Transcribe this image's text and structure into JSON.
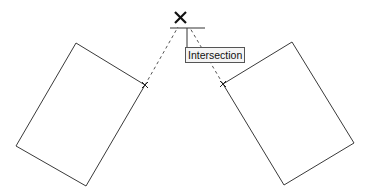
{
  "tooltip": {
    "label": "Intersection"
  },
  "colors": {
    "line": "#3a3a3a",
    "dashed": "#555555",
    "background": "#ffffff"
  },
  "snap": {
    "type": "intersection",
    "point": [
      178,
      27
    ]
  },
  "shapes": {
    "left_rectangle": [
      [
        76,
        43
      ],
      [
        145,
        85
      ],
      [
        86,
        186
      ],
      [
        16,
        146
      ]
    ],
    "right_rectangle": [
      [
        223,
        84
      ],
      [
        292,
        42
      ],
      [
        354,
        143
      ],
      [
        284,
        185
      ]
    ]
  }
}
